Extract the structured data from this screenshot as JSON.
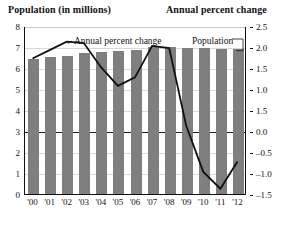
{
  "header": {
    "left_title": "Population (in millions)",
    "right_title": "Annual percent change"
  },
  "annotations": {
    "line_label": "Annual percent change",
    "bar_label": "Population"
  },
  "colors": {
    "bar_fill": "#7f7f7f",
    "line_stroke": "#111111",
    "gridline": "#d8d8d8",
    "zero_line": "#1a1a1a",
    "text": "#111111"
  },
  "chart_data": {
    "type": "bar",
    "title": "",
    "xlabel": "",
    "ylabel": "Population (in millions)",
    "y2label": "Annual percent change",
    "grid": true,
    "legend": "inline-annotations",
    "categories": [
      "'00",
      "'01",
      "'02",
      "'03",
      "'04",
      "'05",
      "'06",
      "'07",
      "'08",
      "'09",
      "'10",
      "'11",
      "'12"
    ],
    "ylim": [
      0,
      8
    ],
    "yticks": [
      0,
      1,
      2,
      3,
      4,
      5,
      6,
      7,
      8
    ],
    "ytick_labels": [
      "0",
      "1",
      "2",
      "3",
      "4",
      "5",
      "6",
      "7",
      "8"
    ],
    "y2lim": [
      -1.5,
      2.5
    ],
    "y2ticks": [
      -1.5,
      -1.0,
      -0.5,
      0.0,
      0.5,
      1.0,
      1.5,
      2.0,
      2.5
    ],
    "y2tick_labels": [
      "–1.5",
      "–1.0",
      "–0.5",
      "0.0",
      "1.5",
      "1.0",
      "1.5",
      "2.0",
      "2.5"
    ],
    "series": [
      {
        "name": "Population",
        "type": "bar",
        "axis": "left",
        "unit": "millions",
        "values": [
          6.42,
          6.53,
          6.58,
          6.7,
          6.78,
          6.8,
          6.88,
          7.0,
          6.98,
          6.95,
          6.93,
          6.92,
          6.9
        ]
      },
      {
        "name": "Annual percent change",
        "type": "line",
        "axis": "right",
        "unit": "percent",
        "values": [
          1.75,
          1.95,
          2.15,
          2.12,
          1.55,
          1.1,
          1.3,
          2.05,
          2.0,
          0.15,
          -0.95,
          -1.35,
          -0.7
        ]
      }
    ]
  }
}
